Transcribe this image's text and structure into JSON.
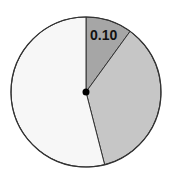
{
  "chart_data": {
    "type": "pie",
    "title": "",
    "start_angle_deg": 0,
    "direction": "clockwise",
    "slices": [
      {
        "label": "0.10",
        "value": 0.1,
        "color": "#a6a6a6",
        "show_label": true
      },
      {
        "label": "",
        "value": 0.36,
        "color": "#c6c6c6",
        "show_label": false
      },
      {
        "label": "",
        "value": 0.54,
        "color": "#f7f7f7",
        "show_label": false
      }
    ],
    "values": [
      0.1,
      0.36,
      0.54
    ],
    "center_dot": true
  },
  "labels": {
    "slice0": "0.10"
  }
}
